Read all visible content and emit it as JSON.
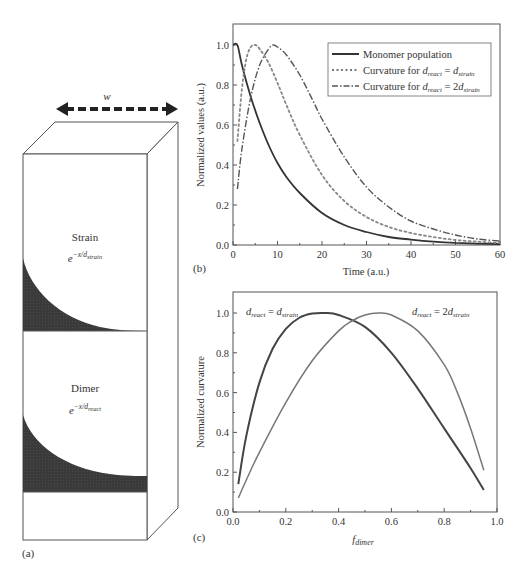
{
  "panel_a": {
    "label": "(a)",
    "width_label": "w",
    "strain_label": "Strain",
    "strain_formula": {
      "base": "e",
      "exp_prefix": "−x/d",
      "exp_sub": "strain"
    },
    "dimer_label": "Dimer",
    "dimer_formula": {
      "base": "e",
      "exp_prefix": "−x/d",
      "exp_sub": "react"
    },
    "colors": {
      "shade": "#3a3a3a",
      "line": "#555555",
      "arrow": "#222222"
    }
  },
  "panel_b": {
    "label": "(b)",
    "legend": [
      {
        "style": "solid",
        "text": "Monomer population"
      },
      {
        "style": "dotted",
        "text_prefix": "Curvature for ",
        "lhs": "d",
        "lhs_sub": "react",
        "eq": " = ",
        "rhs_coef": "",
        "rhs": "d",
        "rhs_sub": "strain"
      },
      {
        "style": "dashdot",
        "text_prefix": "Curvature for ",
        "lhs": "d",
        "lhs_sub": "react",
        "eq": " = ",
        "rhs_coef": "2",
        "rhs": "d",
        "rhs_sub": "strain"
      }
    ]
  },
  "panel_c": {
    "label": "(c)",
    "annotation_left": {
      "lhs": "d",
      "lhs_sub": "react",
      "eq": " = ",
      "rhs_coef": "",
      "rhs": "d",
      "rhs_sub": "strain"
    },
    "annotation_right": {
      "lhs": "d",
      "lhs_sub": "react",
      "eq": " = ",
      "rhs_coef": "2",
      "rhs": "d",
      "rhs_sub": "strain"
    }
  },
  "chart_data": [
    {
      "id": "b",
      "type": "line",
      "title": "",
      "xlabel": "Time (a.u.)",
      "ylabel": "Normalized values (a.u.)",
      "xlim": [
        0,
        60
      ],
      "ylim": [
        0,
        1.1
      ],
      "xticks": [
        0,
        10,
        20,
        30,
        40,
        50,
        60
      ],
      "yticks": [
        0.0,
        0.2,
        0.4,
        0.6,
        0.8,
        1.0
      ],
      "ytick_labels": [
        "0.0",
        "0.2",
        "0.4",
        "0.6",
        "0.8",
        "1.0"
      ],
      "grid": false,
      "legend_position": "upper right",
      "series": [
        {
          "name": "Monomer population",
          "style": "solid",
          "x": [
            0,
            1,
            2,
            4,
            6,
            8,
            10,
            12,
            15,
            20,
            25,
            30,
            35,
            40,
            45,
            50,
            55,
            60
          ],
          "y": [
            1.0,
            1.0,
            0.9,
            0.74,
            0.61,
            0.5,
            0.41,
            0.34,
            0.26,
            0.16,
            0.1,
            0.065,
            0.04,
            0.027,
            0.017,
            0.011,
            0.007,
            0.005
          ]
        },
        {
          "name": "Curvature for d_react = d_strain",
          "style": "dotted",
          "x": [
            1,
            2,
            3,
            4,
            5,
            6,
            8,
            10,
            12,
            15,
            20,
            25,
            30,
            35,
            40,
            45,
            50,
            55,
            60
          ],
          "y": [
            0.52,
            0.78,
            0.93,
            0.99,
            1.0,
            0.98,
            0.91,
            0.81,
            0.7,
            0.55,
            0.35,
            0.22,
            0.14,
            0.09,
            0.06,
            0.04,
            0.025,
            0.017,
            0.01
          ]
        },
        {
          "name": "Curvature for d_react = 2d_strain",
          "style": "dashdot",
          "x": [
            1,
            2,
            4,
            6,
            8,
            9,
            10,
            12,
            15,
            18,
            20,
            25,
            30,
            35,
            40,
            45,
            50,
            55,
            60
          ],
          "y": [
            0.28,
            0.48,
            0.74,
            0.9,
            0.98,
            1.0,
            0.99,
            0.95,
            0.85,
            0.72,
            0.63,
            0.44,
            0.29,
            0.19,
            0.12,
            0.08,
            0.05,
            0.03,
            0.02
          ]
        }
      ]
    },
    {
      "id": "c",
      "type": "line",
      "title": "",
      "xlabel": "f_dimer",
      "ylabel": "Normalized curvature",
      "xlim": [
        0,
        1.0
      ],
      "ylim": [
        0,
        1.1
      ],
      "xticks": [
        0.0,
        0.2,
        0.4,
        0.6,
        0.8,
        1.0
      ],
      "xtick_labels": [
        "0.0",
        "0.2",
        "0.4",
        "0.6",
        "0.8",
        "1.0"
      ],
      "yticks": [
        0.0,
        0.2,
        0.4,
        0.6,
        0.8,
        1.0
      ],
      "ytick_labels": [
        "0.0",
        "0.2",
        "0.4",
        "0.6",
        "0.8",
        "1.0"
      ],
      "grid": false,
      "series": [
        {
          "name": "d_react = d_strain",
          "color": "#444444",
          "x": [
            0.02,
            0.05,
            0.1,
            0.15,
            0.2,
            0.25,
            0.3,
            0.35,
            0.4,
            0.5,
            0.6,
            0.7,
            0.8,
            0.9,
            0.95
          ],
          "y": [
            0.14,
            0.38,
            0.65,
            0.82,
            0.92,
            0.975,
            0.997,
            1.0,
            0.99,
            0.93,
            0.8,
            0.62,
            0.42,
            0.22,
            0.11
          ]
        },
        {
          "name": "d_react = 2d_strain",
          "color": "#777777",
          "x": [
            0.02,
            0.05,
            0.1,
            0.2,
            0.3,
            0.4,
            0.45,
            0.5,
            0.55,
            0.6,
            0.7,
            0.8,
            0.85,
            0.9,
            0.95
          ],
          "y": [
            0.07,
            0.16,
            0.3,
            0.55,
            0.76,
            0.91,
            0.96,
            0.99,
            1.0,
            0.99,
            0.91,
            0.74,
            0.6,
            0.42,
            0.21
          ]
        }
      ]
    }
  ]
}
